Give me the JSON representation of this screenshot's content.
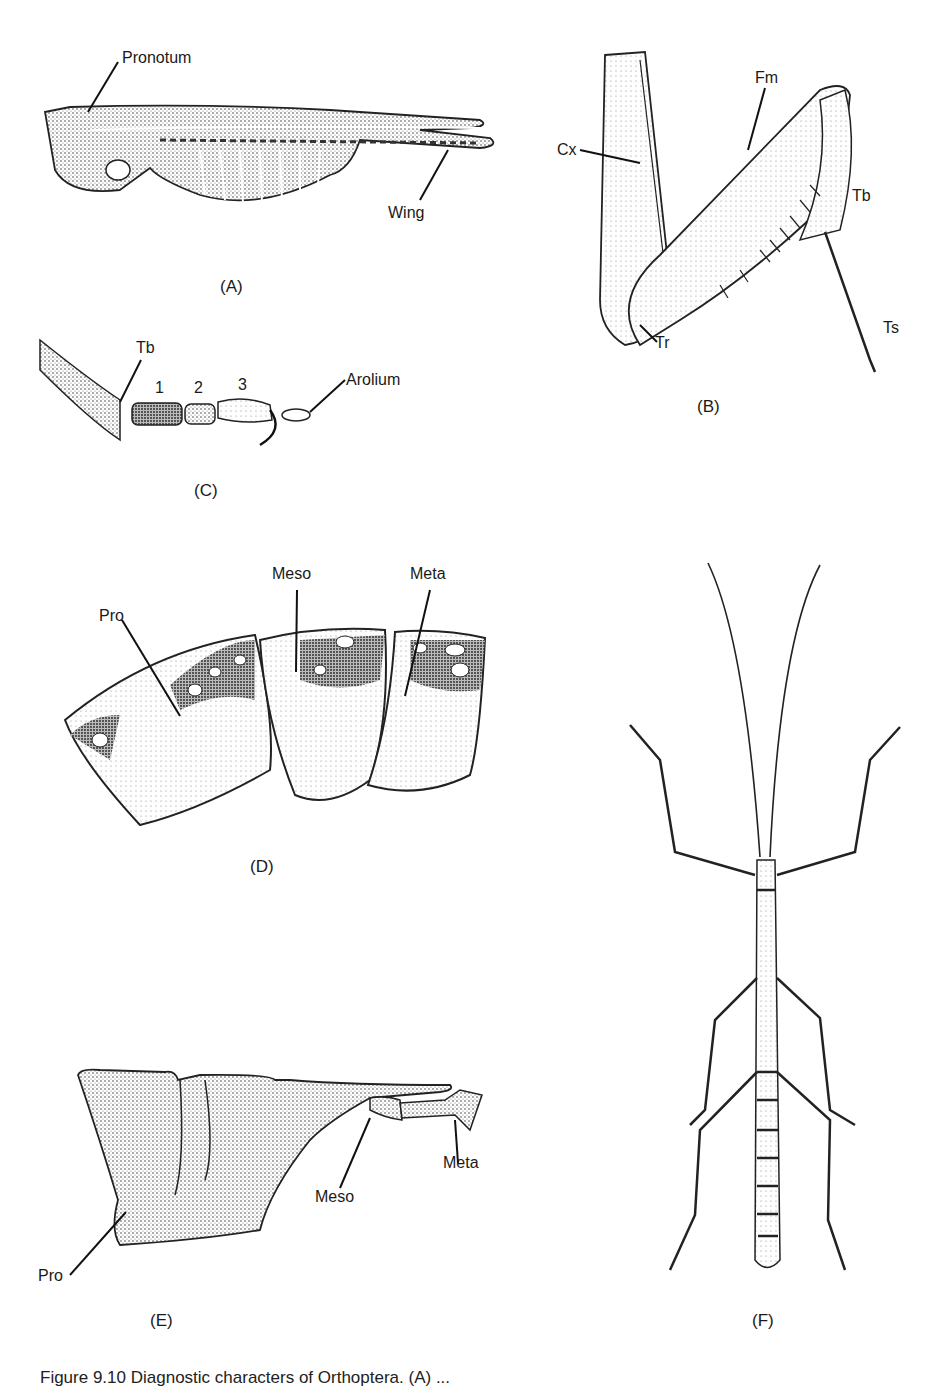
{
  "figure": {
    "panels": [
      {
        "id": "A",
        "label": "(A)",
        "callouts": [
          "Pronotum",
          "Wing"
        ]
      },
      {
        "id": "B",
        "label": "(B)",
        "callouts": [
          "Cx",
          "Fm",
          "Tb",
          "Tr",
          "Ts"
        ]
      },
      {
        "id": "C",
        "label": "(C)",
        "callouts": [
          "Tb",
          "1",
          "2",
          "3",
          "Arolium"
        ]
      },
      {
        "id": "D",
        "label": "(D)",
        "callouts": [
          "Pro",
          "Meso",
          "Meta"
        ]
      },
      {
        "id": "E",
        "label": "(E)",
        "callouts": [
          "Pro",
          "Meso",
          "Meta"
        ]
      },
      {
        "id": "F",
        "label": "(F)",
        "callouts": []
      }
    ],
    "caption": "Figure 9.10 Diagnostic characters of Orthoptera. (A) ..."
  }
}
